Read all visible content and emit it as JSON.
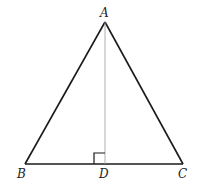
{
  "diagram": {
    "type": "isosceles-triangle-with-altitude",
    "points": {
      "A": {
        "label": "A",
        "x": 105,
        "y": 22
      },
      "B": {
        "label": "B",
        "x": 25,
        "y": 164
      },
      "C": {
        "label": "C",
        "x": 183,
        "y": 164
      },
      "D": {
        "label": "D",
        "x": 105,
        "y": 164
      }
    },
    "segments": [
      "AB",
      "AC",
      "BC",
      "AD"
    ],
    "right_angle_at": "D",
    "colors": {
      "stroke": "#1a1a1a",
      "altitude": "#9a9a9a",
      "background": "#ffffff"
    }
  }
}
